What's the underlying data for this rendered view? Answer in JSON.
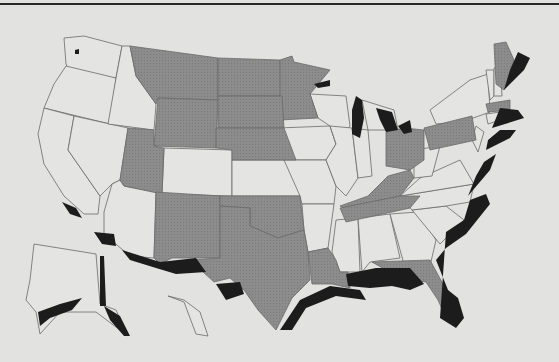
{
  "map": {
    "type": "choropleth",
    "region": "United States",
    "colors": {
      "background": "#e2e2e0",
      "unshaded": "#e4e4e2",
      "shaded": "#8c8c8c",
      "coastal": "#1c1c1c",
      "border": "#6a6a6a"
    },
    "categories": [
      {
        "name": "unshaded",
        "color": "#e4e4e2"
      },
      {
        "name": "shaded-states",
        "color": "#8c8c8c"
      },
      {
        "name": "coastal-zone",
        "color": "#1c1c1c"
      }
    ],
    "shaded_states": [
      "MT",
      "ND",
      "MN",
      "WY",
      "SD",
      "UT",
      "NE",
      "NM",
      "OK",
      "TX",
      "LA",
      "OH",
      "PA",
      "KY",
      "TN",
      "FL",
      "ME",
      "MA"
    ],
    "coastal_zones": [
      "Pacific-SoCal",
      "Gulf-Coast",
      "Atlantic-Coast",
      "Great-Lakes",
      "Alaska-Coast",
      "Lake-Superior"
    ]
  }
}
